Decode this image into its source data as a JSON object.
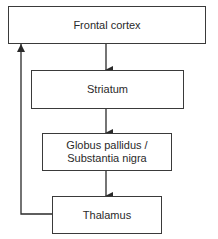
{
  "diagram": {
    "type": "flowchart",
    "nodes": [
      {
        "id": "frontal",
        "label": "Frontal cortex"
      },
      {
        "id": "striatum",
        "label": "Striatum"
      },
      {
        "id": "globus",
        "label": "Globus pallidus /\nSubstantia nigra"
      },
      {
        "id": "thalamus",
        "label": "Thalamus"
      }
    ],
    "edges": [
      {
        "from": "frontal",
        "to": "striatum"
      },
      {
        "from": "striatum",
        "to": "globus"
      },
      {
        "from": "globus",
        "to": "thalamus"
      },
      {
        "from": "thalamus",
        "to": "frontal",
        "kind": "feedback loop"
      }
    ],
    "colors": {
      "stroke": "#3a3a3a",
      "fill": "#ffffff",
      "text": "#2a2a2a"
    }
  }
}
